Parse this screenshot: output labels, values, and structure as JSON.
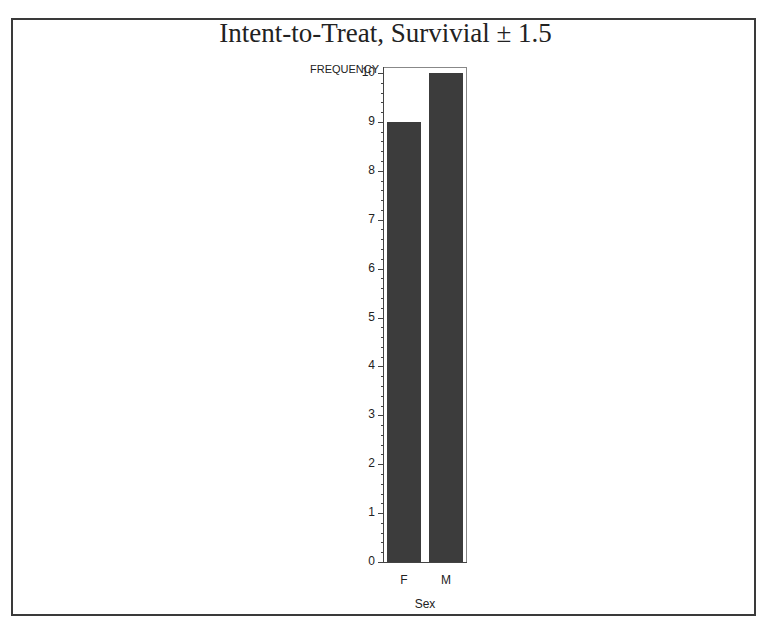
{
  "chart_data": {
    "type": "bar",
    "title": "Intent-to-Treat, Survivial ± 1.5",
    "xlabel": "Sex",
    "ylabel": "FREQUENCY",
    "categories": [
      "F",
      "M"
    ],
    "values": [
      9,
      10
    ],
    "ylim": [
      0,
      10
    ],
    "yticks": [
      0,
      1,
      2,
      3,
      4,
      5,
      6,
      7,
      8,
      9,
      10
    ],
    "grid": false,
    "bar_color": "#3c3c3c"
  }
}
